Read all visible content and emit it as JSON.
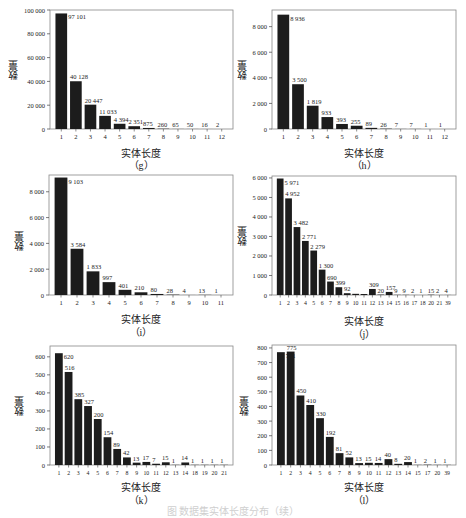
{
  "figure": {
    "caption": "图 数据集实体长度分布（续）"
  },
  "style": {
    "bar_color": "#1c1c1c",
    "axis_color": "#444444",
    "frame_color": "#888888",
    "text_color": "#222222"
  },
  "chart_data": [
    {
      "id": "g",
      "type": "bar",
      "panel_label": "（g）",
      "xlabel": "实体长度",
      "ylabel": "数量",
      "categories": [
        "1",
        "2",
        "3",
        "4",
        "5",
        "6",
        "7",
        "8",
        "9",
        "10",
        "11",
        "12"
      ],
      "values": [
        97101,
        40128,
        20447,
        11033,
        4394,
        2351,
        875,
        260,
        65,
        50,
        16,
        2
      ],
      "value_labels": [
        "97 101",
        "40 128",
        "20 447",
        "11 033",
        "4 394",
        "2 351",
        "875",
        "260",
        "65",
        "50",
        "16",
        "2"
      ],
      "ylim": [
        0,
        100000
      ],
      "yticks": [
        0,
        20000,
        40000,
        60000,
        80000,
        100000
      ],
      "ytick_labels": [
        "0",
        "20 000",
        "40 000",
        "60 000",
        "80 000",
        "100 000"
      ],
      "grid": false
    },
    {
      "id": "h",
      "type": "bar",
      "panel_label": "（h）",
      "xlabel": "实体长度",
      "ylabel": "数量",
      "categories": [
        "1",
        "2",
        "3",
        "4",
        "5",
        "6",
        "7",
        "8",
        "9",
        "10",
        "11",
        "12"
      ],
      "values": [
        8936,
        3500,
        1819,
        933,
        393,
        255,
        89,
        26,
        7,
        7,
        1,
        1
      ],
      "value_labels": [
        "8 936",
        "3 500",
        "1 819",
        "933",
        "393",
        "255",
        "89",
        "26",
        "7",
        "7",
        "1",
        "1"
      ],
      "ylim": [
        0,
        9300
      ],
      "yticks": [
        0,
        2000,
        4000,
        6000,
        8000
      ],
      "ytick_labels": [
        "0",
        "2 000",
        "4 000",
        "6 000",
        "8 000"
      ],
      "grid": false
    },
    {
      "id": "i",
      "type": "bar",
      "panel_label": "（i）",
      "xlabel": "实体长度",
      "ylabel": "数量",
      "categories": [
        "1",
        "2",
        "3",
        "4",
        "5",
        "6",
        "7",
        "8",
        "9",
        "10",
        "11"
      ],
      "values": [
        9103,
        3584,
        1833,
        997,
        401,
        210,
        80,
        28,
        4,
        13,
        1
      ],
      "value_labels": [
        "9 103",
        "3 584",
        "1 833",
        "997",
        "401",
        "210",
        "80",
        "28",
        "4",
        "13",
        "1"
      ],
      "ylim": [
        0,
        9300
      ],
      "yticks": [
        0,
        2000,
        4000,
        6000,
        8000
      ],
      "ytick_labels": [
        "0",
        "2 000",
        "4 000",
        "6 000",
        "8 000"
      ],
      "grid": false
    },
    {
      "id": "j",
      "type": "bar",
      "panel_label": "（j）",
      "xlabel": "实体长度",
      "ylabel": "数量",
      "categories": [
        "1",
        "2",
        "3",
        "4",
        "5",
        "6",
        "7",
        "8",
        "9",
        "10",
        "11",
        "12",
        "13",
        "14",
        "15",
        "16",
        "17",
        "18",
        "20",
        "21",
        "39"
      ],
      "values": [
        5971,
        4952,
        3482,
        2771,
        2279,
        1300,
        690,
        399,
        92,
        60,
        50,
        309,
        20,
        157,
        9,
        9,
        2,
        1,
        15,
        2,
        4
      ],
      "value_labels": [
        "5 971",
        "4 952",
        "3 482",
        "2 771",
        "2 279",
        "1 300",
        "690",
        "399",
        "92",
        "",
        "",
        "309",
        "20",
        "157",
        "9",
        "9",
        "2",
        "1",
        "15",
        "2",
        "4"
      ],
      "ylim": [
        0,
        6100
      ],
      "yticks": [
        0,
        1000,
        2000,
        3000,
        4000,
        5000,
        6000
      ],
      "ytick_labels": [
        "0",
        "1 000",
        "2 000",
        "3 000",
        "4 000",
        "5 000",
        "6 000"
      ],
      "grid": false
    },
    {
      "id": "k",
      "type": "bar",
      "panel_label": "（k）",
      "xlabel": "实体长度",
      "ylabel": "数量",
      "categories": [
        "1",
        "2",
        "3",
        "4",
        "5",
        "6",
        "7",
        "8",
        "9",
        "10",
        "11",
        "12",
        "13",
        "14",
        "18",
        "19",
        "20",
        "21"
      ],
      "values": [
        620,
        516,
        365,
        327,
        255,
        154,
        89,
        42,
        13,
        17,
        7,
        15,
        1,
        14,
        1,
        1,
        1,
        1
      ],
      "value_labels": [
        "620",
        "516",
        "385",
        "327",
        "200",
        "154",
        "89",
        "42",
        "13",
        "17",
        "7",
        "15",
        "1",
        "14",
        "1",
        "1",
        "1",
        "1"
      ],
      "ylim": [
        0,
        660
      ],
      "yticks": [
        0,
        100,
        200,
        300,
        400,
        500,
        600
      ],
      "ytick_labels": [
        "0",
        "100",
        "200",
        "300",
        "400",
        "500",
        "600"
      ],
      "grid": false
    },
    {
      "id": "l",
      "type": "bar",
      "panel_label": "（l）",
      "xlabel": "实体长度",
      "ylabel": "数量",
      "categories": [
        "1",
        "2",
        "3",
        "4",
        "5",
        "6",
        "7",
        "8",
        "9",
        "10",
        "11",
        "12",
        "13",
        "14",
        "15",
        "17",
        "20",
        "39"
      ],
      "values": [
        771,
        775,
        475,
        410,
        320,
        192,
        81,
        52,
        13,
        15,
        14,
        40,
        8,
        20,
        1,
        2,
        1,
        1
      ],
      "value_labels": [
        "771",
        "775",
        "450",
        "410",
        "330",
        "192",
        "81",
        "52",
        "13",
        "15",
        "14",
        "40",
        "8",
        "20",
        "1",
        "2",
        "1",
        "1"
      ],
      "ylim": [
        0,
        820
      ],
      "yticks": [
        0,
        100,
        200,
        300,
        400,
        500,
        600,
        700,
        800
      ],
      "ytick_labels": [
        "0",
        "100",
        "200",
        "300",
        "400",
        "500",
        "600",
        "700",
        "800"
      ],
      "grid": false
    }
  ]
}
